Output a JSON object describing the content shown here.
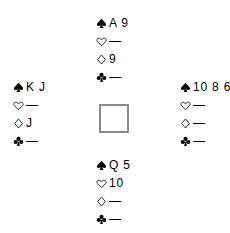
{
  "diagram": {
    "background_color": "#ffffff",
    "text_color": "#000000",
    "center_square": {
      "border_color": "#8a8a8a",
      "fill_color": "#ffffff"
    },
    "suits": [
      {
        "key": "spades",
        "name": "spade-icon",
        "glyph": "♠",
        "filled": true
      },
      {
        "key": "hearts",
        "name": "heart-icon",
        "glyph": "♡",
        "filled": false
      },
      {
        "key": "diamonds",
        "name": "diamond-icon",
        "glyph": "♢",
        "filled": false
      },
      {
        "key": "clubs",
        "name": "club-icon",
        "glyph": "♣",
        "filled": true
      }
    ],
    "void_symbol": "—",
    "hands": {
      "north": {
        "position": "north",
        "spades": "A 9",
        "hearts": "—",
        "diamonds": "9",
        "clubs": "—"
      },
      "west": {
        "position": "west",
        "spades": "K J",
        "hearts": "—",
        "diamonds": "J",
        "clubs": "—"
      },
      "east": {
        "position": "east",
        "spades": "10 8 6",
        "hearts": "—",
        "diamonds": "—",
        "clubs": "—"
      },
      "south": {
        "position": "south",
        "spades": "Q 5",
        "hearts": "10",
        "diamonds": "—",
        "clubs": "—"
      }
    }
  }
}
